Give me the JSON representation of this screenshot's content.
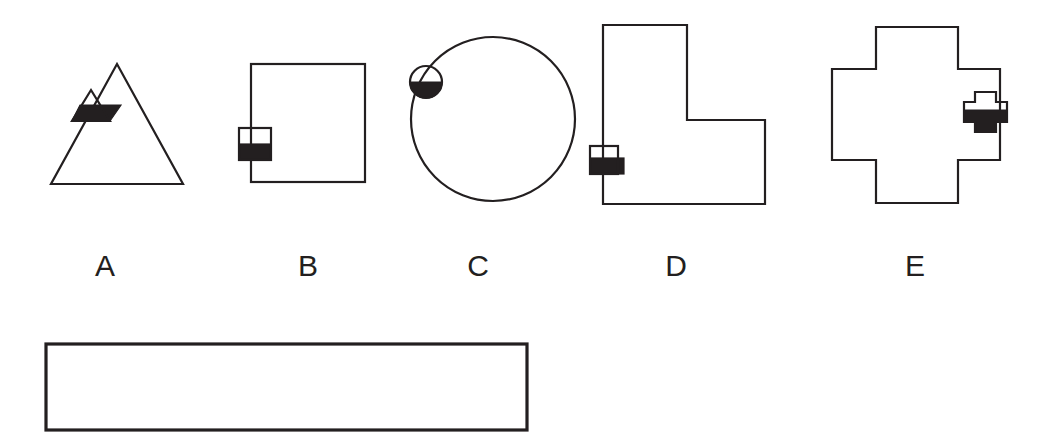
{
  "page": {
    "background_color": "#ffffff",
    "ink_color": "#231f20",
    "width": 1055,
    "height": 446
  },
  "figures": [
    {
      "id": "figure-a",
      "label": "A",
      "shape_kind": "triangle",
      "marker_kind": "triangle",
      "marker_fill": "half-filled-black",
      "label_x": 105,
      "label_y": 276,
      "outline_points": "117,64 183,184 51,184",
      "marker_points": "91,90 110,121 72,121",
      "marker_fill_points": "80,105 121,105 110,121 72,121",
      "marker_fill_color": "#231f20"
    },
    {
      "id": "figure-b",
      "label": "B",
      "shape_kind": "square",
      "marker_kind": "square",
      "marker_fill": "bottom-half-black",
      "label_x": 308,
      "label_y": 276,
      "outline_rect": {
        "x": 251,
        "y": 64,
        "width": 114,
        "height": 118
      },
      "marker_rect": {
        "x": 239,
        "y": 128,
        "width": 32,
        "height": 32
      },
      "marker_fill_rect": {
        "x": 239,
        "y": 144,
        "width": 32,
        "height": 16
      },
      "marker_fill_color": "#231f20"
    },
    {
      "id": "figure-c",
      "label": "C",
      "shape_kind": "circle",
      "marker_kind": "circle",
      "marker_fill": "bottom-half-black",
      "label_x": 478,
      "label_y": 276,
      "outline_circle": {
        "cx": 493,
        "cy": 119,
        "r": 82
      },
      "marker_circle": {
        "cx": 426,
        "cy": 82,
        "r": 16
      },
      "marker_fill_color": "#231f20"
    },
    {
      "id": "figure-d",
      "label": "D",
      "shape_kind": "l-shape",
      "marker_kind": "square",
      "marker_fill": "bottom-half-black",
      "label_x": 676,
      "label_y": 276,
      "outline_points": "603,25 687,25 687,120 765,120 765,204 603,204",
      "marker_rect": {
        "x": 590,
        "y": 146,
        "width": 28,
        "height": 28
      },
      "marker_fill_rect": {
        "x": 590,
        "y": 158,
        "width": 34,
        "height": 16
      },
      "marker_fill_color": "#231f20"
    },
    {
      "id": "figure-e",
      "label": "E",
      "shape_kind": "cross",
      "marker_kind": "cross",
      "marker_fill": "bottom-half-black",
      "label_x": 915,
      "label_y": 276,
      "outline_points": "876,27 958,27 958,69 1000,69 1000,160 958,160 958,203 876,203 876,160 832,160 832,69 876,69",
      "marker_points": "975,92 996,92 996,102 1007,102 1007,122 996,122 996,132 975,132 975,122 964,122 964,102 975,102",
      "marker_fill_points": "964,110 1007,110 1007,122 996,122 996,132 975,132 975,122 964,122",
      "marker_fill_color": "#231f20"
    }
  ],
  "answer_box": {
    "id": "answer-box",
    "value": "",
    "rect": {
      "x": 46,
      "y": 344,
      "width": 481,
      "height": 86
    }
  }
}
